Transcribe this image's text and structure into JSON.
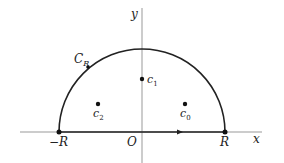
{
  "diagram": {
    "axes": {
      "x_label": "x",
      "y_label": "y",
      "origin_label": "O"
    },
    "contour": {
      "label_main": "C",
      "label_sub": "R"
    },
    "endpoints": {
      "left": "−R",
      "right": "R"
    },
    "points": [
      {
        "main": "c",
        "sub": "1"
      },
      {
        "main": "c",
        "sub": "2"
      },
      {
        "main": "c",
        "sub": "0"
      }
    ],
    "colors": {
      "line": "#222222",
      "axis": "#888888"
    }
  }
}
